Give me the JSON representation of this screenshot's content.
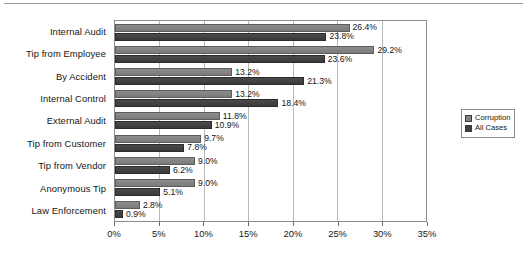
{
  "chart_data": {
    "type": "bar",
    "orientation": "horizontal",
    "title": "",
    "subtitle": "",
    "xlabel": "",
    "ylabel": "",
    "xlim": [
      0,
      35
    ],
    "xticks": [
      "0%",
      "5%",
      "10%",
      "15%",
      "20%",
      "25%",
      "30%",
      "35%"
    ],
    "xtick_values": [
      0,
      5,
      10,
      15,
      20,
      25,
      30,
      35
    ],
    "grid": true,
    "legend_position": "right",
    "categories": [
      "Internal Audit",
      "Tip from Employee",
      "By Accident",
      "Internal Control",
      "External Audit",
      "Tip from Customer",
      "Tip from Vendor",
      "Anonymous Tip",
      "Law Enforcement"
    ],
    "series": [
      {
        "name": "Corruption",
        "color": "#838383",
        "values": [
          26.4,
          29.2,
          13.2,
          13.2,
          11.8,
          9.7,
          9.0,
          9.0,
          2.8
        ],
        "labels": [
          "26.4%",
          "29.2%",
          "13.2%",
          "13.2%",
          "11.8%",
          "9.7%",
          "9.0%",
          "9.0%",
          "2.8%"
        ]
      },
      {
        "name": "All Cases",
        "color": "#3f3f3f",
        "values": [
          23.8,
          23.6,
          21.3,
          18.4,
          10.9,
          7.8,
          6.2,
          5.1,
          0.9
        ],
        "labels": [
          "23.8%",
          "23.6%",
          "21.3%",
          "18.4%",
          "10.9%",
          "7.8%",
          "6.2%",
          "5.1%",
          "0.9%"
        ]
      }
    ]
  },
  "legend": {
    "items": [
      {
        "label": "Corruption",
        "key": "corruption"
      },
      {
        "label": "All Cases",
        "key": "allcases"
      }
    ]
  }
}
